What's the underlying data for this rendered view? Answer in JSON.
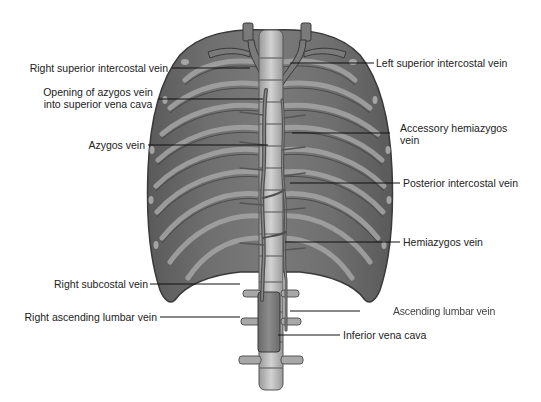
{
  "figure": {
    "labels": {
      "right_superior_intercostal_vein": "Right superior intercostal vein",
      "opening_azygos_line1": "Opening of azygos vein",
      "opening_azygos_line2": "into superior vena cava",
      "azygos_vein": "Azygos vein",
      "right_subcostal_vein": "Right subcostal vein",
      "right_ascending_lumbar_vein": "Right ascending lumbar vein",
      "left_superior_intercostal_vein": "Left superior intercostal vein",
      "accessory_hemiazygos_line1": "Accessory hemiazygos",
      "accessory_hemiazygos_line2": "vein",
      "posterior_intercostal_vein": "Posterior intercostal vein",
      "hemiazygos_vein": "Hemiazygos vein",
      "ascending_lumbar_vein": "Ascending lumbar vein",
      "inferior_vena_cava": "Inferior vena cava"
    },
    "colors": {
      "background": "#ffffff",
      "muscle_dark": "#4a4a4a",
      "muscle_mid": "#6e6e6e",
      "rib_light": "#9a9a9a",
      "vertebra": "#b8b8b8",
      "vein": "#5c5c5c",
      "leader_line": "#111111",
      "label_text": "#222222"
    }
  }
}
